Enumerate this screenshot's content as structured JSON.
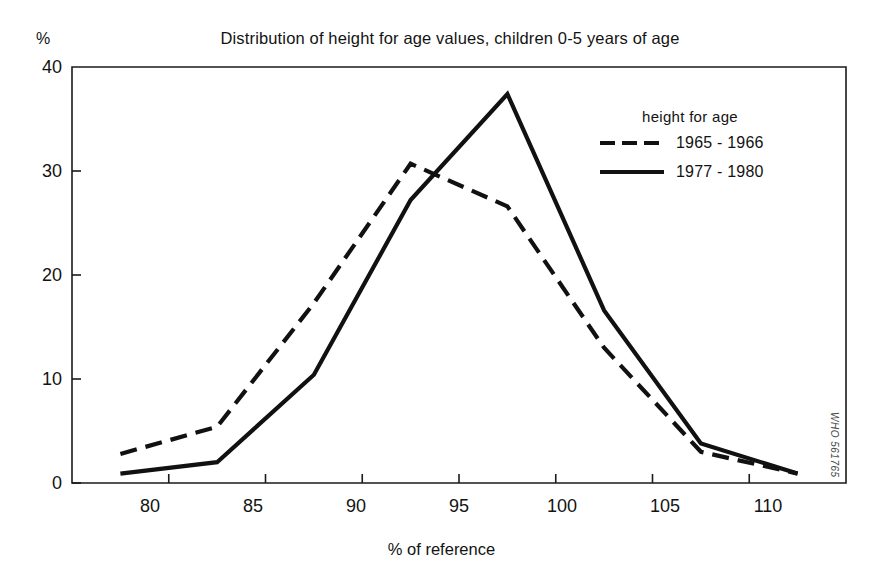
{
  "chart_data": {
    "type": "line",
    "title": "Distribution of height for age values, children 0-5 years of age",
    "xlabel": "% of reference",
    "ylabel": "%",
    "x": [
      77.5,
      82.5,
      87.5,
      92.5,
      97.5,
      102.5,
      107.5,
      112.5
    ],
    "xlim": [
      75,
      115
    ],
    "ylim": [
      0,
      40
    ],
    "xticks": [
      80,
      85,
      90,
      95,
      100,
      105,
      110
    ],
    "yticks": [
      0,
      10,
      20,
      30,
      40
    ],
    "grid": false,
    "legend_position": "upper-right",
    "legend_title": "height for age",
    "series": [
      {
        "name": "1965 - 1966",
        "style": "dashed",
        "color": "#111111",
        "values": [
          2.8,
          5.4,
          17.3,
          30.7,
          26.6,
          13.0,
          3.0,
          0.9
        ]
      },
      {
        "name": "1977 - 1980",
        "style": "solid",
        "color": "#111111",
        "values": [
          0.9,
          2.0,
          10.4,
          27.2,
          37.4,
          16.6,
          3.8,
          0.9
        ]
      }
    ],
    "annotations": [
      "WHO 561765"
    ]
  },
  "axes": {
    "y_unit": "%",
    "y_tick_labels": [
      "0",
      "10",
      "20",
      "30",
      "40"
    ],
    "x_tick_labels": [
      "80",
      "85",
      "90",
      "95",
      "100",
      "105",
      "110"
    ],
    "x_title": "% of reference"
  },
  "legend": {
    "title": "height for age",
    "entries": [
      {
        "label": "1965 - 1966",
        "style": "dashed"
      },
      {
        "label": "1977 - 1980",
        "style": "solid"
      }
    ]
  },
  "watermark": {
    "text": "WHO 561765"
  }
}
